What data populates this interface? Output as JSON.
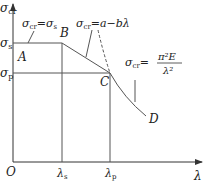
{
  "diagram": {
    "axes": {
      "y_label": "σ",
      "y_label_sub": "cr",
      "x_label": "λ",
      "origin": "O"
    },
    "levels": {
      "sigma_s": {
        "symbol": "σ",
        "sub": "s"
      },
      "sigma_p": {
        "symbol": "σ",
        "sub": "p"
      }
    },
    "x_ticks": {
      "lambda_s": {
        "symbol": "λ",
        "sub": "s"
      },
      "lambda_p": {
        "symbol": "λ",
        "sub": "p"
      }
    },
    "points": {
      "A": "A",
      "B": "B",
      "C": "C",
      "D": "D"
    },
    "formulas": {
      "yield": {
        "lhs": "σ",
        "lhs_sub": "cr",
        "eq": "=",
        "rhs": "σ",
        "rhs_sub": "s"
      },
      "linear": {
        "lhs": "σ",
        "lhs_sub": "cr",
        "eq": "=",
        "rhs": "a−bλ"
      },
      "euler": {
        "lhs": "σ",
        "lhs_sub": "cr",
        "eq": "=",
        "numerator": "π²E",
        "denominator": "λ²"
      }
    },
    "regions": [
      {
        "name": "short column (yield)",
        "from": "O",
        "to": "λs",
        "formula": "σcr = σs"
      },
      {
        "name": "intermediate column (linear)",
        "from": "λs",
        "to": "λp",
        "formula": "σcr = a − bλ"
      },
      {
        "name": "slender column (Euler)",
        "from": "λp",
        "to": "∞",
        "formula": "σcr = π²E/λ²"
      }
    ]
  }
}
